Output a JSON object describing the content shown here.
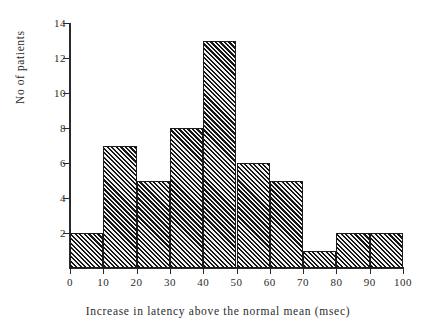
{
  "chart_data": {
    "type": "bar",
    "title": "",
    "subtitle": "",
    "xlabel": "Increase  in  latency  above  the  normal  mean  (msec)",
    "ylabel": "No  of  patients",
    "categories": [
      "0-10",
      "10-20",
      "20-30",
      "30-40",
      "40-50",
      "50-60",
      "60-70",
      "70-80",
      "80-90",
      "90-100"
    ],
    "bin_edges": [
      0,
      10,
      20,
      30,
      40,
      50,
      60,
      70,
      80,
      90,
      100
    ],
    "values": [
      2,
      7,
      5,
      8,
      13,
      6,
      5,
      1,
      2,
      2
    ],
    "series": [
      {
        "name": "No of patients",
        "values": [
          2,
          7,
          5,
          8,
          13,
          6,
          5,
          1,
          2,
          2
        ]
      }
    ],
    "xticks": [
      "0",
      "10",
      "20",
      "30",
      "40",
      "50",
      "60",
      "70",
      "80",
      "90",
      "100"
    ],
    "xtick_values": [
      0,
      10,
      20,
      30,
      40,
      50,
      60,
      70,
      80,
      90,
      100
    ],
    "yticks": [
      "2",
      "4",
      "6",
      "8",
      "10",
      "12",
      "14"
    ],
    "ytick_values": [
      2,
      4,
      6,
      8,
      10,
      12,
      14
    ],
    "xlim": [
      0,
      100
    ],
    "ylim": [
      0,
      14
    ],
    "grid": false,
    "legend": false,
    "legend_position": "none",
    "bar_fill": "hatched-diagonal",
    "colors": {
      "background": "#ffffff",
      "axis": "#2a2a2a",
      "bar_line": "#161616",
      "bar_gap": "#f2f2f2",
      "text": "#2b2b2b"
    }
  }
}
